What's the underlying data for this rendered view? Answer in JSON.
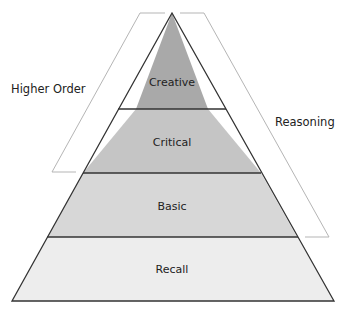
{
  "diagram": {
    "type": "pyramid",
    "levels": [
      {
        "label": "Creative",
        "color": "#a9a9a9"
      },
      {
        "label": "Critical",
        "color": "#c5c5c5"
      },
      {
        "label": "Basic",
        "color": "#d7d7d7"
      },
      {
        "label": "Recall",
        "color": "#ededed"
      }
    ],
    "brackets": {
      "left_label": "Higher Order",
      "right_label": "Reasoning"
    },
    "colors": {
      "outline": "#333333",
      "bracket": "#b0b0b0"
    }
  }
}
